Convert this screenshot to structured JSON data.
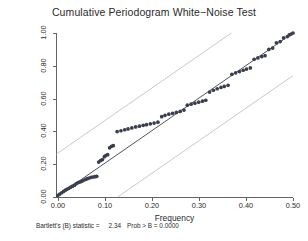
{
  "title": "Cumulative Periodogram White−Noise Test",
  "axes": {
    "xlabel": "Frequency",
    "ylabel": "Cumulative periodogram for x2",
    "xticks": [
      "0.00",
      "0.10",
      "0.20",
      "0.30",
      "0.40",
      "0.50"
    ],
    "yticks": [
      "0.00",
      "0.20",
      "0.40",
      "0.60",
      "0.80",
      "1.00"
    ],
    "xlim": [
      0.0,
      0.5
    ],
    "ylim": [
      0.0,
      1.0
    ]
  },
  "footnote": {
    "statistic_label": "Bartlett's (B) statistic =",
    "statistic_value": "2.34",
    "prob_label": "Prob > B =",
    "prob_value": "0.0000"
  },
  "colors": {
    "marker": "#3a3f4d",
    "reference_line": "#3a3f4d",
    "band_line": "#b2b2b2",
    "axis": "#636363",
    "text": "#2a2a2a",
    "background": "#ffffff"
  },
  "chart_data": {
    "type": "scatter",
    "title": "Cumulative Periodogram White−Noise Test",
    "xlabel": "Frequency",
    "ylabel": "Cumulative periodogram for x2",
    "xlim": [
      0.0,
      0.5
    ],
    "ylim": [
      0.0,
      1.0
    ],
    "grid": false,
    "legend": null,
    "series": [
      {
        "name": "Cumulative periodogram",
        "type": "scatter",
        "marker": "filled-circle",
        "x": [
          0.004,
          0.008,
          0.012,
          0.016,
          0.02,
          0.023,
          0.027,
          0.031,
          0.035,
          0.039,
          0.043,
          0.047,
          0.051,
          0.055,
          0.059,
          0.063,
          0.066,
          0.07,
          0.074,
          0.078,
          0.082,
          0.086,
          0.09,
          0.094,
          0.098,
          0.102,
          0.105,
          0.109,
          0.113,
          0.117,
          0.121,
          0.129,
          0.137,
          0.145,
          0.152,
          0.16,
          0.168,
          0.176,
          0.184,
          0.191,
          0.199,
          0.207,
          0.215,
          0.223,
          0.23,
          0.238,
          0.246,
          0.254,
          0.262,
          0.27,
          0.277,
          0.285,
          0.293,
          0.301,
          0.309,
          0.316,
          0.324,
          0.332,
          0.34,
          0.348,
          0.355,
          0.363,
          0.371,
          0.379,
          0.387,
          0.395,
          0.402,
          0.41,
          0.418,
          0.426,
          0.434,
          0.441,
          0.449,
          0.457,
          0.465,
          0.473,
          0.48,
          0.488,
          0.492,
          0.496,
          0.5
        ],
        "y": [
          0.01,
          0.018,
          0.026,
          0.034,
          0.042,
          0.047,
          0.053,
          0.06,
          0.066,
          0.072,
          0.082,
          0.088,
          0.092,
          0.097,
          0.103,
          0.108,
          0.112,
          0.116,
          0.12,
          0.122,
          0.124,
          0.126,
          0.213,
          0.222,
          0.228,
          0.246,
          0.253,
          0.258,
          0.3,
          0.309,
          0.313,
          0.399,
          0.404,
          0.41,
          0.415,
          0.421,
          0.427,
          0.432,
          0.437,
          0.441,
          0.446,
          0.451,
          0.456,
          0.49,
          0.498,
          0.505,
          0.51,
          0.516,
          0.522,
          0.53,
          0.56,
          0.566,
          0.572,
          0.578,
          0.584,
          0.59,
          0.64,
          0.651,
          0.66,
          0.668,
          0.674,
          0.681,
          0.748,
          0.757,
          0.765,
          0.773,
          0.78,
          0.787,
          0.84,
          0.848,
          0.856,
          0.862,
          0.9,
          0.908,
          0.94,
          0.948,
          0.97,
          0.978,
          0.988,
          0.994,
          1.0
        ]
      },
      {
        "name": "45-degree reference line",
        "type": "line",
        "x": [
          0.0,
          0.5
        ],
        "y": [
          0.0,
          1.0
        ]
      },
      {
        "name": "Upper confidence band",
        "type": "line",
        "x": [
          0.0,
          0.37
        ],
        "y": [
          0.26,
          1.0
        ]
      },
      {
        "name": "Lower confidence band",
        "type": "line",
        "x": [
          0.13,
          0.5
        ],
        "y": [
          0.0,
          0.74
        ]
      }
    ]
  }
}
